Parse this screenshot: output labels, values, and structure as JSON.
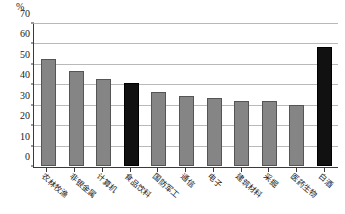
{
  "chart_data": {
    "type": "bar",
    "title": "",
    "subtitle": "",
    "xlabel": "",
    "ylabel": "%",
    "unit_label": "%",
    "ylim": [
      0,
      70
    ],
    "ytick_step": 10,
    "yticks": [
      "0",
      "10",
      "20",
      "30",
      "40",
      "50",
      "60",
      "70"
    ],
    "grid": true,
    "legend": "none",
    "categories": [
      "农林牧渔",
      "非银金属",
      "计算机",
      "食品饮料",
      "国防军工",
      "通信",
      "电子",
      "建筑材料",
      "采掘",
      "医药生物",
      "白酒"
    ],
    "values": [
      53,
      47,
      43,
      41,
      36.5,
      34.5,
      33.5,
      32,
      32,
      30,
      58.5
    ],
    "bar_colors": [
      "gray",
      "gray",
      "gray",
      "black",
      "gray",
      "gray",
      "gray",
      "gray",
      "gray",
      "gray",
      "black"
    ],
    "colors": {
      "gray_bar": "#858585",
      "black_bar": "#111111",
      "gridline": "#b9b9b9",
      "axis": "#3a3a3a",
      "background": "#ffffff"
    }
  }
}
